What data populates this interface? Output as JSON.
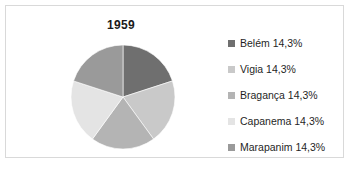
{
  "chart_data": {
    "type": "pie",
    "title": "1959",
    "categories": [
      "Belém",
      "Vigia",
      "Bragança",
      "Capanema",
      "Marapanim"
    ],
    "values": [
      14.3,
      14.3,
      14.3,
      14.3,
      14.3
    ],
    "value_suffix": "%",
    "legend_position": "right",
    "grid": false,
    "legend_entries": [
      {
        "label": "Belém 14,3%",
        "name": "Belém",
        "value": "14,3%",
        "color": "#6f6f6f"
      },
      {
        "label": "Vigia 14,3%",
        "name": "Vigia",
        "value": "14,3%",
        "color": "#c9c9c9"
      },
      {
        "label": "Bragança 14,3%",
        "name": "Bragança",
        "value": "14,3%",
        "color": "#b4b4b4"
      },
      {
        "label": "Capanema 14,3%",
        "name": "Capanema",
        "value": "14,3%",
        "color": "#e4e4e4"
      },
      {
        "label": "Marapanim 14,3%",
        "name": "Marapanim",
        "value": "14,3%",
        "color": "#9a9a9a"
      }
    ],
    "slices": [
      {
        "name": "Belém",
        "value": 14.3,
        "color": "#6f6f6f",
        "start_angle": 0,
        "end_angle": 72
      },
      {
        "name": "Vigia",
        "value": 14.3,
        "color": "#c9c9c9",
        "start_angle": 72,
        "end_angle": 144
      },
      {
        "name": "Bragança",
        "value": 14.3,
        "color": "#b4b4b4",
        "start_angle": 144,
        "end_angle": 216
      },
      {
        "name": "Capanema",
        "value": 14.3,
        "color": "#e4e4e4",
        "start_angle": 216,
        "end_angle": 288
      },
      {
        "name": "Marapanim",
        "value": 14.3,
        "color": "#9a9a9a",
        "start_angle": 288,
        "end_angle": 360
      }
    ]
  },
  "frame": {
    "border_color": "#d9d9d9",
    "background": "#ffffff"
  }
}
